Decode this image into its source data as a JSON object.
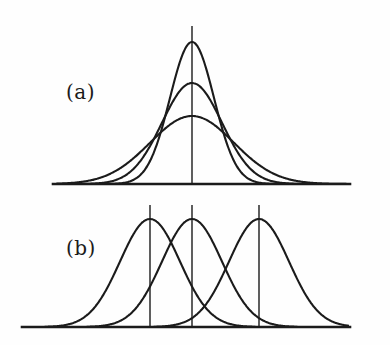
{
  "figure": {
    "title": "",
    "background_color": "#fefefe",
    "stroke_color": "#1b1b1b",
    "width": 390,
    "height": 345
  },
  "panels": [
    {
      "id": "panel-a",
      "label": "(a)",
      "label_x": 66,
      "label_y": 80,
      "description": "Three Gaussian curves with a common mean and different amplitudes and widths"
    },
    {
      "id": "panel-b",
      "label": "(b)",
      "label_x": 66,
      "label_y": 236,
      "description": "Three Gaussian curves of equal amplitude with shifted means"
    }
  ],
  "chart_data": [
    {
      "type": "line",
      "id": "panel-a",
      "title": "(a)",
      "xlabel": "",
      "ylabel": "",
      "grid": false,
      "legend": "none",
      "baseline_y": 184,
      "baseline_x_range": [
        53,
        350
      ],
      "axis_range_x": [
        53,
        350
      ],
      "axis_range_y": [
        26,
        184
      ],
      "center_line": {
        "x": 192,
        "y_top": 26,
        "y_bottom": 184
      },
      "series": [
        {
          "name": "narrow-tall",
          "mean": 192,
          "sigma": 22,
          "peak_x": 192,
          "peak_y": 42,
          "amplitude": 142
        },
        {
          "name": "medium",
          "mean": 192,
          "sigma": 30,
          "peak_x": 192,
          "peak_y": 83,
          "amplitude": 101
        },
        {
          "name": "wide-short",
          "mean": 192,
          "sigma": 42,
          "peak_x": 192,
          "peak_y": 116,
          "amplitude": 68
        }
      ]
    },
    {
      "type": "line",
      "id": "panel-b",
      "title": "(b)",
      "xlabel": "",
      "ylabel": "",
      "grid": false,
      "legend": "none",
      "baseline_y": 327,
      "baseline_x_range": [
        22,
        350
      ],
      "axis_range_x": [
        22,
        350
      ],
      "axis_range_y": [
        205,
        327
      ],
      "center_lines": [
        {
          "x": 150,
          "y_top": 205,
          "y_bottom": 327
        },
        {
          "x": 192,
          "y_top": 205,
          "y_bottom": 327
        },
        {
          "x": 259,
          "y_top": 205,
          "y_bottom": 327
        }
      ],
      "series": [
        {
          "name": "left",
          "mean": 150,
          "sigma": 30,
          "peak_x": 150,
          "peak_y": 219,
          "amplitude": 108
        },
        {
          "name": "center",
          "mean": 192,
          "sigma": 30,
          "peak_x": 192,
          "peak_y": 219,
          "amplitude": 108
        },
        {
          "name": "right",
          "mean": 259,
          "sigma": 30,
          "peak_x": 259,
          "peak_y": 219,
          "amplitude": 108
        }
      ]
    }
  ]
}
